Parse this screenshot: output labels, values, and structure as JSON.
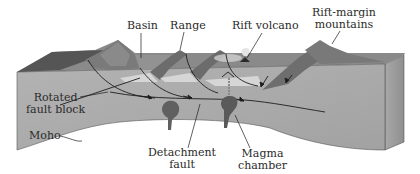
{
  "diagram": {
    "type": "block-diagram",
    "labels": {
      "basin": "Basin",
      "range": "Range",
      "rift_volcano": "Rift volcano",
      "rift_margin_line1": "Rift-margin",
      "rift_margin_line2": "mountains",
      "rotated_line1": "Rotated",
      "rotated_line2": "fault block",
      "moho": "Moho",
      "detachment_line1": "Detachment",
      "detachment_line2": "fault",
      "magma_line1": "Magma",
      "magma_line2": "chamber"
    },
    "colors": {
      "front_face": "#a9a9a9",
      "top_surface": "#8e8e8e",
      "side_face": "#9a9a9a",
      "dark_slope": "#5a5a5a",
      "mountain_texture": "#7a7a7a",
      "magma": "#5e5e5e",
      "line": "#1e1e1e",
      "sediment": "#d2d2d2"
    }
  }
}
